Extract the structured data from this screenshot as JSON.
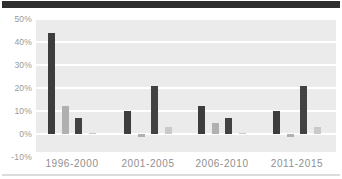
{
  "header": {
    "top_bar_color": "#2e2e2e"
  },
  "footer": {
    "divider_color": "#dcdcdc"
  },
  "chart_data": {
    "type": "bar",
    "title": "",
    "xlabel": "",
    "ylabel": "",
    "categories": [
      "1996-2000",
      "2001-2005",
      "2006-2010",
      "2011-2015"
    ],
    "series": [
      {
        "name": "series-1",
        "color": "#3d3d3d",
        "values": [
          44,
          10,
          12,
          10
        ]
      },
      {
        "name": "series-2",
        "color": "#b0b0b0",
        "values": [
          12,
          -1.5,
          5,
          -1.5
        ]
      },
      {
        "name": "series-3",
        "color": "#424242",
        "values": [
          7,
          21,
          7,
          21
        ]
      },
      {
        "name": "series-4",
        "color": "#c9c9c9",
        "values": [
          0.5,
          3,
          0.5,
          3
        ]
      }
    ],
    "y_ticks": [
      "50%",
      "40%",
      "30%",
      "20%",
      "10%",
      "0%",
      "-10%"
    ],
    "y_tick_values": [
      50,
      40,
      30,
      20,
      10,
      0,
      -10
    ],
    "ylim": [
      -10,
      50
    ],
    "grid": true,
    "legend": "none",
    "plot_bg": "#ebebeb",
    "gridline_color": "#ffffff",
    "tick_color": "#999999"
  }
}
